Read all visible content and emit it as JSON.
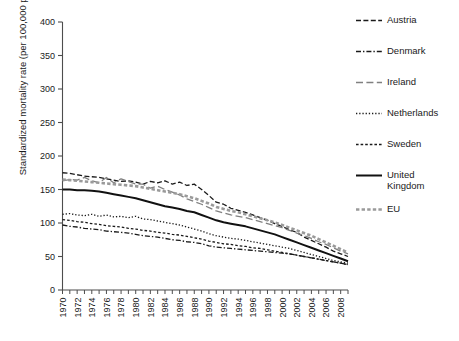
{
  "chart_data": {
    "type": "line",
    "title": "",
    "xlabel": "",
    "ylabel": "Standardized mortality rate (per 100,000 population)",
    "xlim": [
      1970,
      2009
    ],
    "ylim": [
      0,
      400
    ],
    "ytick_labels": [
      "0",
      "50",
      "100",
      "150",
      "200",
      "250",
      "300",
      "350",
      "400"
    ],
    "ytick_values": [
      0,
      50,
      100,
      150,
      200,
      250,
      300,
      350,
      400
    ],
    "xtick_labels": [
      "1970",
      "1972",
      "1974",
      "1976",
      "1978",
      "1980",
      "1982",
      "1984",
      "1986",
      "1988",
      "1990",
      "1992",
      "1994",
      "1996",
      "1998",
      "2000",
      "2002",
      "2004",
      "2006",
      "2008"
    ],
    "xtick_values": [
      1970,
      1972,
      1974,
      1976,
      1978,
      1980,
      1982,
      1984,
      1986,
      1988,
      1990,
      1992,
      1994,
      1996,
      1998,
      2000,
      2002,
      2004,
      2006,
      2008
    ],
    "minor_xticks_every": 1,
    "grid": false,
    "legend_position": "right",
    "x": [
      1970,
      1971,
      1972,
      1973,
      1974,
      1975,
      1976,
      1977,
      1978,
      1979,
      1980,
      1981,
      1982,
      1983,
      1984,
      1985,
      1986,
      1987,
      1988,
      1989,
      1990,
      1991,
      1992,
      1993,
      1994,
      1995,
      1996,
      1997,
      1998,
      1999,
      2000,
      2001,
      2002,
      2003,
      2004,
      2005,
      2006,
      2007,
      2008,
      2009
    ],
    "series": [
      {
        "name": "Austria",
        "style": "dashed",
        "color": "#1a1a1a",
        "width": 1.3,
        "values": [
          175,
          174,
          172,
          170,
          169,
          168,
          166,
          164,
          162,
          163,
          161,
          158,
          162,
          160,
          163,
          158,
          161,
          156,
          158,
          150,
          141,
          131,
          128,
          122,
          119,
          116,
          112,
          108,
          104,
          99,
          95,
          90,
          86,
          79,
          74,
          69,
          64,
          58,
          54,
          50
        ]
      },
      {
        "name": "Denmark",
        "style": "dashdot",
        "color": "#1a1a1a",
        "width": 1.3,
        "values": [
          97,
          95,
          94,
          92,
          91,
          90,
          88,
          87,
          86,
          85,
          83,
          81,
          80,
          79,
          77,
          75,
          74,
          72,
          71,
          69,
          66,
          64,
          63,
          62,
          61,
          60,
          59,
          58,
          57,
          56,
          55,
          54,
          52,
          50,
          48,
          46,
          44,
          42,
          40,
          38
        ]
      },
      {
        "name": "Ireland",
        "style": "longdash",
        "color": "#808080",
        "width": 1.3,
        "values": [
          163,
          165,
          164,
          168,
          163,
          160,
          168,
          160,
          166,
          162,
          158,
          158,
          152,
          155,
          150,
          146,
          142,
          136,
          132,
          128,
          123,
          118,
          115,
          112,
          110,
          108,
          105,
          102,
          99,
          96,
          93,
          89,
          85,
          81,
          77,
          72,
          68,
          63,
          58,
          54
        ]
      },
      {
        "name": "Netherlands",
        "style": "dotted",
        "color": "#1a1a1a",
        "width": 1.3,
        "values": [
          113,
          114,
          112,
          111,
          113,
          110,
          112,
          109,
          110,
          108,
          110,
          106,
          105,
          103,
          101,
          99,
          97,
          94,
          91,
          88,
          84,
          81,
          79,
          77,
          76,
          74,
          72,
          70,
          68,
          66,
          64,
          62,
          59,
          56,
          53,
          50,
          47,
          44,
          42,
          40
        ]
      },
      {
        "name": "Sweden",
        "style": "shortdash",
        "color": "#1a1a1a",
        "width": 1.3,
        "values": [
          105,
          104,
          102,
          101,
          99,
          98,
          96,
          95,
          94,
          92,
          91,
          89,
          88,
          86,
          85,
          83,
          82,
          80,
          78,
          76,
          73,
          71,
          69,
          68,
          66,
          65,
          63,
          62,
          60,
          58,
          56,
          54,
          52,
          50,
          48,
          46,
          44,
          42,
          40,
          38
        ]
      },
      {
        "name": "United Kingdom",
        "style": "solid",
        "color": "#111111",
        "width": 2.0,
        "values": [
          150,
          150,
          149,
          149,
          148,
          147,
          145,
          143,
          141,
          139,
          137,
          134,
          131,
          128,
          125,
          123,
          121,
          118,
          116,
          112,
          108,
          104,
          101,
          99,
          97,
          95,
          92,
          89,
          86,
          83,
          79,
          75,
          71,
          67,
          63,
          59,
          55,
          51,
          47,
          43
        ]
      },
      {
        "name": "EU",
        "style": "eu-dash",
        "color": "#9a9a9a",
        "width": 2.6,
        "values": [
          165,
          164,
          163,
          162,
          161,
          160,
          159,
          158,
          157,
          156,
          155,
          153,
          151,
          149,
          147,
          145,
          143,
          140,
          137,
          133,
          129,
          124,
          121,
          118,
          116,
          113,
          110,
          107,
          104,
          101,
          97,
          93,
          89,
          85,
          81,
          76,
          71,
          66,
          61,
          56
        ]
      }
    ]
  },
  "legend": {
    "items": [
      {
        "label": "Austria",
        "key": "dashed-line-key"
      },
      {
        "label": "Denmark",
        "key": "dashdot-line-key"
      },
      {
        "label": "Ireland",
        "key": "longdash-line-key"
      },
      {
        "label": "Netherlands",
        "key": "dotted-line-key"
      },
      {
        "label": "Sweden",
        "key": "shortdash-line-key"
      },
      {
        "label": "United\nKingdom",
        "key": "solid-line-key"
      },
      {
        "label": "EU",
        "key": "eu-dash-line-key"
      }
    ]
  },
  "colors": {
    "axis": "#4d4d4d",
    "text": "#1a1a1a",
    "gray_series": "#808080",
    "eu_series": "#9a9a9a",
    "background": "#ffffff"
  }
}
